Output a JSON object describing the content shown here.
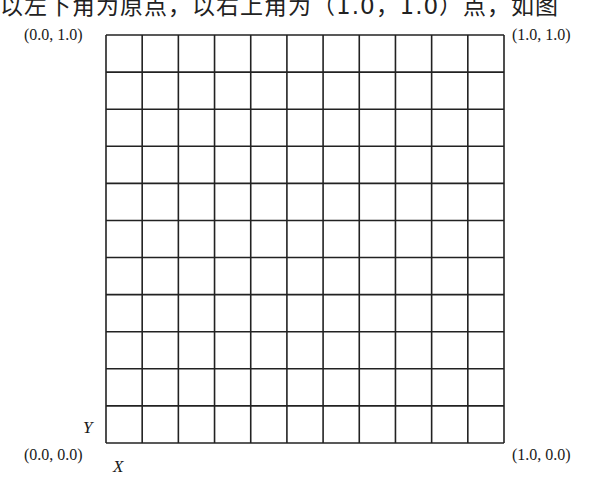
{
  "caption_fragment": "以左下角为原点，以右上角为（1.0，1.0）点，如图",
  "grid": {
    "columns": 11,
    "rows": 11,
    "left": 106,
    "top": 35,
    "right": 504,
    "bottom": 443,
    "line_color": "#222222",
    "line_width": 1.6
  },
  "corners": {
    "top_left": "(0.0, 1.0)",
    "top_right": "(1.0, 1.0)",
    "bottom_left": "(0.0, 0.0)",
    "bottom_right": "(1.0, 0.0)"
  },
  "axes": {
    "y_label": "Y",
    "x_label": "X"
  }
}
